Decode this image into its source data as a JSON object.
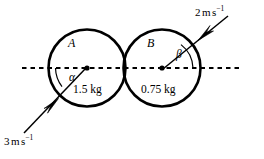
{
  "figure": {
    "type": "physics-collision-diagram",
    "background_color": "#ffffff",
    "stroke_color": "#000000",
    "width": 264,
    "height": 159
  },
  "reference_line": {
    "name": "line-of-centres",
    "style": "dashed",
    "y": 68,
    "x_start": 22,
    "x_end": 240
  },
  "bodies": [
    {
      "id": "A",
      "letter": "A",
      "mass": "1.5 kg",
      "center_x": 87,
      "center_y": 68,
      "radius": 38.5
    },
    {
      "id": "B",
      "letter": "B",
      "mass": "0.75 kg",
      "center_x": 162,
      "center_y": 68,
      "radius": 38.5
    }
  ],
  "angles": [
    {
      "id": "alpha",
      "symbol": "α",
      "at_body": "A",
      "label_x": 74,
      "label_y": 73
    },
    {
      "id": "beta",
      "symbol": "β",
      "at_body": "B",
      "label_x": 175,
      "label_y": 53
    }
  ],
  "velocity_vectors": [
    {
      "id": "v-A",
      "speed_value": "3",
      "unit_m": "m",
      "unit_s": "s",
      "unit_exp": "−1",
      "full_label": "3 m s−1",
      "direction": "up-right",
      "tail_x": 24,
      "tail_y": 133,
      "head_x": 86,
      "head_y": 68,
      "label_x": 4,
      "label_y": 140
    },
    {
      "id": "v-B",
      "speed_value": "2",
      "unit_m": "m",
      "unit_s": "s",
      "unit_exp": "−1",
      "full_label": "2 m s−1",
      "direction": "down-left",
      "tail_x": 228,
      "tail_y": 16,
      "head_x": 163,
      "head_y": 69,
      "label_x": 193,
      "label_y": 6
    }
  ]
}
